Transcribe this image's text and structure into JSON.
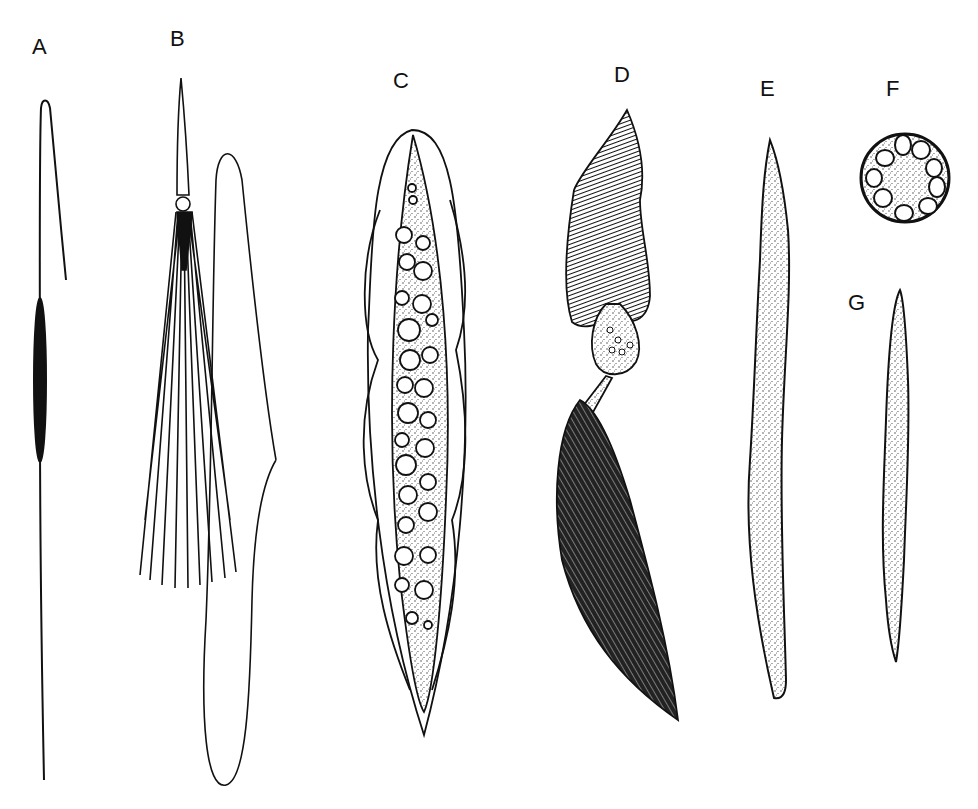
{
  "figure": {
    "panels": [
      {
        "id": "A",
        "label": "A",
        "description": "slender elongated cell with dark central nucleus"
      },
      {
        "id": "B",
        "label": "B",
        "description": "tapered cell with bundle of fibres and separate elongated outline"
      },
      {
        "id": "C",
        "label": "C",
        "description": "fusiform stippled cell with vacuoles inside undulating membrane"
      },
      {
        "id": "D",
        "label": "D",
        "description": "striated head, vacuolated middle piece and densely ciliated tail"
      },
      {
        "id": "E",
        "label": "E",
        "description": "long stippled spindle-shaped cell"
      },
      {
        "id": "F",
        "label": "F",
        "description": "cross-section showing ring of vacuoles around granular core"
      },
      {
        "id": "G",
        "label": "G",
        "description": "small stippled spindle-shaped cell"
      }
    ],
    "colors": {
      "ink": "#111111",
      "paper": "#ffffff",
      "stipple": "#d8d8d8"
    }
  }
}
